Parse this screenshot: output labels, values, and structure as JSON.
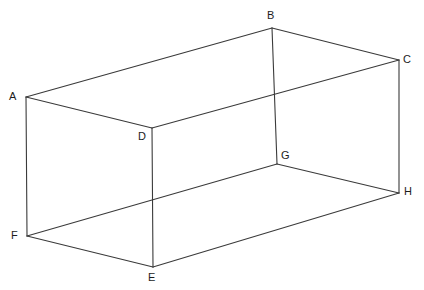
{
  "figure": {
    "kind": "wireframe-diagram",
    "shape_name": "rectangular prism",
    "background_color": "#ffffff",
    "line_color": "#3a3a3a",
    "label_color": "#1c1c1c",
    "width": 424,
    "height": 290
  },
  "vertices": [
    {
      "id": "A",
      "label": "A",
      "x": 26,
      "y": 97,
      "label_x": 9,
      "label_y": 91
    },
    {
      "id": "B",
      "label": "B",
      "x": 272,
      "y": 28,
      "label_x": 267,
      "label_y": 10
    },
    {
      "id": "C",
      "label": "C",
      "x": 399,
      "y": 60,
      "label_x": 403,
      "label_y": 54
    },
    {
      "id": "D",
      "label": "D",
      "x": 152,
      "y": 128,
      "label_x": 138,
      "label_y": 131
    },
    {
      "id": "E",
      "label": "E",
      "x": 153,
      "y": 267,
      "label_x": 148,
      "label_y": 272
    },
    {
      "id": "F",
      "label": "F",
      "x": 27,
      "y": 236,
      "label_x": 11,
      "label_y": 230
    },
    {
      "id": "G",
      "label": "G",
      "x": 277,
      "y": 164,
      "label_x": 281,
      "label_y": 150
    },
    {
      "id": "H",
      "label": "H",
      "x": 399,
      "y": 193,
      "label_x": 404,
      "label_y": 186
    }
  ],
  "edges": [
    {
      "from": "A",
      "to": "B",
      "name": "edge-a-b"
    },
    {
      "from": "B",
      "to": "C",
      "name": "edge-b-c"
    },
    {
      "from": "A",
      "to": "D",
      "name": "edge-a-d"
    },
    {
      "from": "D",
      "to": "C",
      "name": "edge-d-c"
    },
    {
      "from": "B",
      "to": "G",
      "name": "edge-b-g"
    },
    {
      "from": "A",
      "to": "F",
      "name": "edge-a-f"
    },
    {
      "from": "D",
      "to": "E",
      "name": "edge-d-e"
    },
    {
      "from": "C",
      "to": "H",
      "name": "edge-c-h"
    },
    {
      "from": "F",
      "to": "E",
      "name": "edge-f-e"
    },
    {
      "from": "E",
      "to": "H",
      "name": "edge-e-h"
    },
    {
      "from": "F",
      "to": "G",
      "name": "edge-f-g"
    },
    {
      "from": "G",
      "to": "H",
      "name": "edge-g-h"
    }
  ]
}
